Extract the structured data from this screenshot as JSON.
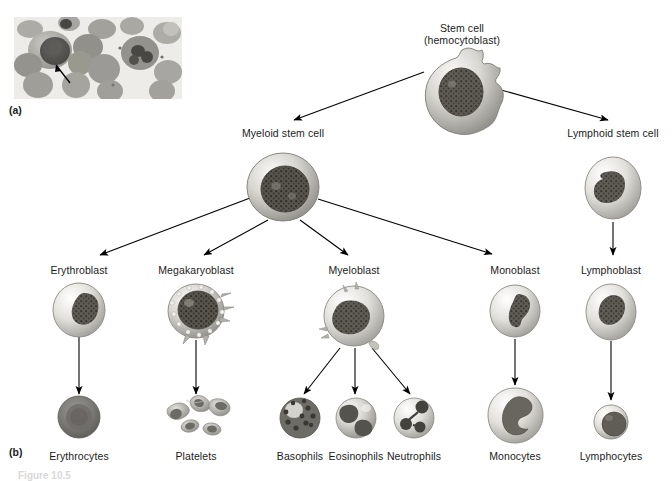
{
  "figure": {
    "panels": [
      {
        "tag": "(a)",
        "type": "micrograph",
        "description": "light micrograph of bone marrow smear with arrow pointing to a cell"
      },
      {
        "tag": "(b)",
        "type": "flow-diagram",
        "description": "hematopoiesis lineage flow chart"
      }
    ],
    "bottom_caption": "Figure 10.5"
  },
  "nodes": [
    {
      "id": "stem-cell",
      "label_line1": "Stem cell",
      "label_line2": "(hemocytoblast)",
      "x": 462,
      "y": 22,
      "cell_cx": 462,
      "cell_cy": 88,
      "cell_rx": 40,
      "cell_ry": 38,
      "shape": "ruffled"
    },
    {
      "id": "myeloid-stem-cell",
      "label_line1": "Myeloid stem cell",
      "label_line2": "",
      "x": 283,
      "y": 127,
      "cell_cx": 283,
      "cell_cy": 187,
      "cell_rx": 36,
      "cell_ry": 34,
      "shape": "round"
    },
    {
      "id": "lymphoid-stem-cell",
      "label_line1": "Lymphoid stem cell",
      "label_line2": "",
      "x": 613,
      "y": 127,
      "cell_cx": 613,
      "cell_cy": 188,
      "cell_rx": 28,
      "cell_ry": 31,
      "shape": "round"
    },
    {
      "id": "erythroblast",
      "label_line1": "Erythroblast",
      "label_line2": "",
      "x": 79,
      "y": 264,
      "cell_cx": 79,
      "cell_cy": 310,
      "cell_rx": 26,
      "cell_ry": 27,
      "shape": "round"
    },
    {
      "id": "megakaryoblast",
      "label_line1": "Megakaryoblast",
      "label_line2": "",
      "x": 196,
      "y": 264,
      "cell_cx": 196,
      "cell_cy": 311,
      "cell_rx": 28,
      "cell_ry": 27,
      "shape": "spiky"
    },
    {
      "id": "myeloblast",
      "label_line1": "Myeloblast",
      "label_line2": "",
      "x": 354,
      "y": 264,
      "cell_cx": 354,
      "cell_cy": 316,
      "cell_rx": 30,
      "cell_ry": 30,
      "shape": "spiky"
    },
    {
      "id": "monoblast",
      "label_line1": "Monoblast",
      "label_line2": "",
      "x": 515,
      "y": 264,
      "cell_cx": 515,
      "cell_cy": 311,
      "cell_rx": 25,
      "cell_ry": 26,
      "shape": "round"
    },
    {
      "id": "lymphoblast",
      "label_line1": "Lymphoblast",
      "label_line2": "",
      "x": 611,
      "y": 264,
      "cell_cx": 611,
      "cell_cy": 312,
      "cell_rx": 25,
      "cell_ry": 28,
      "shape": "round"
    },
    {
      "id": "erythrocytes",
      "label_line1": "Erythrocytes",
      "label_line2": "",
      "x": 79,
      "y": 450,
      "cell_cx": 79,
      "cell_cy": 417,
      "cell_rx": 21,
      "cell_ry": 21,
      "shape": "biconcave"
    },
    {
      "id": "platelets",
      "label_line1": "Platelets",
      "label_line2": "",
      "x": 196,
      "y": 450,
      "cell_cx": 196,
      "cell_cy": 418,
      "cell_rx": 34,
      "cell_ry": 22,
      "shape": "platelets"
    },
    {
      "id": "basophils",
      "label_line1": "Basophils",
      "label_line2": "",
      "x": 300,
      "y": 450,
      "cell_cx": 300,
      "cell_cy": 418,
      "cell_rx": 20,
      "cell_ry": 20,
      "shape": "granular-dark"
    },
    {
      "id": "eosinophils",
      "label_line1": "Eosinophils",
      "label_line2": "",
      "x": 356,
      "y": 450,
      "cell_cx": 356,
      "cell_cy": 418,
      "cell_rx": 20,
      "cell_ry": 20,
      "shape": "bilobed"
    },
    {
      "id": "neutrophils",
      "label_line1": "Neutrophils",
      "label_line2": "",
      "x": 414,
      "y": 450,
      "cell_cx": 414,
      "cell_cy": 418,
      "cell_rx": 20,
      "cell_ry": 20,
      "shape": "multilobed"
    },
    {
      "id": "monocytes",
      "label_line1": "Monocytes",
      "label_line2": "",
      "x": 515,
      "y": 450,
      "cell_cx": 515,
      "cell_cy": 415,
      "cell_rx": 27,
      "cell_ry": 27,
      "shape": "kidney"
    },
    {
      "id": "lymphocytes",
      "label_line1": "Lymphocytes",
      "label_line2": "",
      "x": 611,
      "y": 450,
      "cell_cx": 611,
      "cell_cy": 422,
      "cell_rx": 17,
      "cell_ry": 17,
      "shape": "small-round"
    }
  ],
  "connections": [
    {
      "from": "stem-cell",
      "to": "myeloid-stem-cell",
      "x1": 424,
      "y1": 72,
      "x2": 294,
      "y2": 120,
      "arrow": true
    },
    {
      "from": "stem-cell",
      "to": "lymphoid-stem-cell",
      "x1": 494,
      "y1": 88,
      "x2": 608,
      "y2": 120,
      "arrow": true
    },
    {
      "from": "myeloid-stem-cell",
      "to": "erythroblast",
      "x1": 250,
      "y1": 198,
      "x2": 100,
      "y2": 255,
      "arrow": true
    },
    {
      "from": "myeloid-stem-cell",
      "to": "megakaryoblast",
      "x1": 268,
      "y1": 220,
      "x2": 204,
      "y2": 255,
      "arrow": true
    },
    {
      "from": "myeloid-stem-cell",
      "to": "myeloblast",
      "x1": 300,
      "y1": 220,
      "x2": 348,
      "y2": 255,
      "arrow": true
    },
    {
      "from": "myeloid-stem-cell",
      "to": "monoblast",
      "x1": 318,
      "y1": 199,
      "x2": 492,
      "y2": 254,
      "arrow": true
    },
    {
      "from": "lymphoid-stem-cell",
      "to": "lymphoblast",
      "x1": 613,
      "y1": 222,
      "x2": 613,
      "y2": 255,
      "arrow": true
    },
    {
      "from": "erythroblast",
      "to": "erythrocytes",
      "x1": 79,
      "y1": 337,
      "x2": 79,
      "y2": 394,
      "arrow": true
    },
    {
      "from": "megakaryoblast",
      "to": "platelets",
      "x1": 196,
      "y1": 340,
      "x2": 196,
      "y2": 394,
      "arrow": true
    },
    {
      "from": "myeloblast",
      "to": "basophils",
      "x1": 340,
      "y1": 348,
      "x2": 304,
      "y2": 394,
      "arrow": true
    },
    {
      "from": "myeloblast",
      "to": "eosinophils",
      "x1": 355,
      "y1": 348,
      "x2": 355,
      "y2": 394,
      "arrow": true
    },
    {
      "from": "myeloblast",
      "to": "neutrophils",
      "x1": 372,
      "y1": 348,
      "x2": 410,
      "y2": 394,
      "arrow": true
    },
    {
      "from": "monoblast",
      "to": "monocytes",
      "x1": 515,
      "y1": 339,
      "x2": 515,
      "y2": 385,
      "arrow": true
    },
    {
      "from": "lymphoblast",
      "to": "lymphocytes",
      "x1": 611,
      "y1": 341,
      "x2": 611,
      "y2": 400,
      "arrow": true
    }
  ],
  "colors": {
    "background": "#ffffff",
    "text": "#1b1b1b",
    "arrow": "#000000",
    "cell_light": "#f0efed",
    "cell_mid": "#b9b7b2",
    "cell_dark": "#6d6b67",
    "nucleus": "#4a4845",
    "erythrocyte": "#7d7b77",
    "micrograph_bg": "#e9e8e6"
  }
}
